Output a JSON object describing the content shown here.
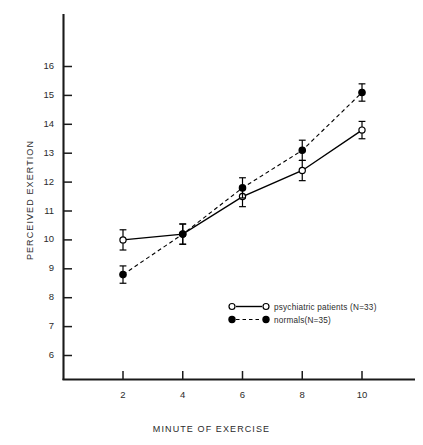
{
  "chart_data": {
    "type": "line",
    "title": "",
    "xlabel": "MINUTE OF EXERCISE",
    "ylabel": "PERCEIVED EXERTION",
    "x": [
      2,
      4,
      6,
      8,
      10
    ],
    "xlim": [
      0.6,
      11.6
    ],
    "ylim": [
      5.4,
      16.9
    ],
    "xticks": [
      2,
      4,
      6,
      8,
      10
    ],
    "yticks": [
      6,
      7,
      8,
      9,
      10,
      11,
      12,
      13,
      14,
      15,
      16
    ],
    "xticklabels": [
      "2",
      "4",
      "6",
      "8",
      "10"
    ],
    "yticklabels": [
      "6",
      "7",
      "8",
      "9",
      "10",
      "11",
      "12",
      "13",
      "14",
      "15",
      "16"
    ],
    "grid": false,
    "legend_position": "lower right",
    "series": [
      {
        "name": "psychiatric patients (N=33)",
        "marker": "open-circle",
        "linestyle": "solid",
        "color": "#000000",
        "values": [
          10.0,
          10.2,
          11.5,
          12.4,
          13.8
        ],
        "errors": [
          0.35,
          0.35,
          0.35,
          0.35,
          0.3
        ]
      },
      {
        "name": "normals(N=35)",
        "marker": "filled-circle",
        "linestyle": "dashed",
        "color": "#000000",
        "values": [
          8.8,
          10.2,
          11.8,
          13.1,
          15.1
        ],
        "errors": [
          0.3,
          0.35,
          0.35,
          0.35,
          0.3
        ]
      }
    ]
  },
  "legend": {
    "entries": [
      {
        "label": "psychiatric patients (N=33)",
        "marker": "open-circle",
        "linestyle": "solid"
      },
      {
        "label": "normals(N=35)",
        "marker": "filled-circle",
        "linestyle": "dashed"
      }
    ]
  },
  "axes": {
    "x_title": "MINUTE OF EXERCISE",
    "y_title": "PERCEIVED EXERTION"
  }
}
